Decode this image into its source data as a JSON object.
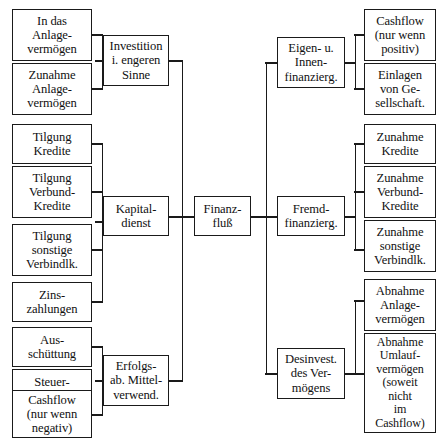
{
  "diagram": {
    "line_color": "#1a1a1a",
    "box_border_color": "#1a1a1a",
    "background": "#ffffff",
    "center": {
      "label": "Finanz-\nfluß"
    },
    "col2": {
      "investition": "Investition\ni. engeren\nSinne",
      "kapitaldienst": "Kapital-\ndienst",
      "erfolgsab": "Erfolgs-\nab. Mittel-\nverwend."
    },
    "col3": {
      "eigen_innen": "Eigen- u.\nInnen-\nfinanzierg.",
      "fremd": "Fremd-\nfinanzierg.",
      "desinvest": "Desinvest.\ndes Ver-\nmögens"
    },
    "left_group1": [
      "In das\nAnlage-\nvermögen",
      "Zunahme\nAnlage-\nvermögen"
    ],
    "left_group2": [
      "Tilgung\nKredite",
      "Tilgung\nVerbund-\nKredite",
      "Tilgung\nsonstige\nVerbindlk.",
      "Zins-\nzahlungen"
    ],
    "left_group3": [
      "Aus-\nschüttung",
      "Steuer-\nzahlungen",
      "Cashflow\n(nur wenn\nnegativ)"
    ],
    "right_group1": [
      "Cashflow\n(nur wenn\npositiv)",
      "Einlagen\nvon Ge-\nsellschaft."
    ],
    "right_group2": [
      "Zunahme\nKredite",
      "Zunahme\nVerbund-\nKredite",
      "Zunahme\nsonstige\nVerbindlk."
    ],
    "right_group3": [
      "Abnahme\nAnlage-\nvermögen",
      "Abnahme\nUmlauf-\nvermögen\n(soweit\nnicht\nim\nCashflow)"
    ]
  }
}
